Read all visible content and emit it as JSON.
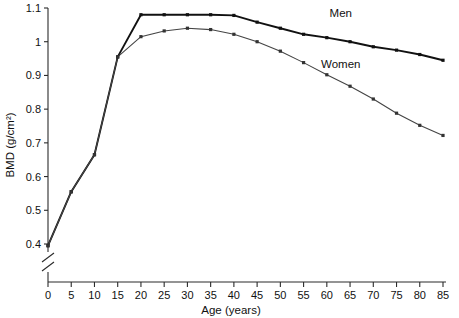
{
  "chart_data": {
    "type": "line",
    "title": "",
    "xlabel": "Age (years)",
    "ylabel": "BMD (g/cm²)",
    "xlim": [
      0,
      85
    ],
    "ylim": [
      0.4,
      1.1
    ],
    "y_axis_break": true,
    "grid": false,
    "legend_position": "inline-right",
    "xticks": [
      0,
      5,
      10,
      15,
      20,
      25,
      30,
      35,
      40,
      45,
      50,
      55,
      60,
      65,
      70,
      75,
      80,
      85
    ],
    "xtick_labels": [
      "0",
      "5",
      "10",
      "15",
      "20",
      "25",
      "30",
      "35",
      "40",
      "45",
      "50",
      "55",
      "60",
      "65",
      "70",
      "75",
      "80",
      "85"
    ],
    "yticks": [
      0.4,
      0.5,
      0.6,
      0.7,
      0.8,
      0.9,
      1.0,
      1.1
    ],
    "ytick_labels": [
      "0.4",
      "0.5",
      "0.6",
      "0.7",
      "0.8",
      "0.9",
      "1",
      "1.1"
    ],
    "x": [
      0,
      5,
      10,
      15,
      20,
      25,
      30,
      35,
      40,
      45,
      50,
      55,
      60,
      65,
      70,
      75,
      80,
      85
    ],
    "series": [
      {
        "name": "Men",
        "color": "#111111",
        "values": [
          0.395,
          0.555,
          0.665,
          0.955,
          1.08,
          1.08,
          1.08,
          1.08,
          1.078,
          1.058,
          1.04,
          1.022,
          1.012,
          1.0,
          0.985,
          0.975,
          0.962,
          0.945
        ],
        "label_text": "Men",
        "label_x": 63,
        "label_y": 1.085
      },
      {
        "name": "Women",
        "color": "#444444",
        "values": [
          0.395,
          0.555,
          0.665,
          0.955,
          1.015,
          1.032,
          1.04,
          1.036,
          1.022,
          1.0,
          0.972,
          0.938,
          0.902,
          0.868,
          0.83,
          0.788,
          0.752,
          0.722
        ],
        "label_text": "Women",
        "label_x": 63,
        "label_y": 0.935
      }
    ]
  }
}
